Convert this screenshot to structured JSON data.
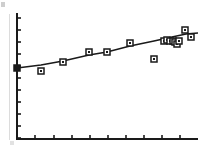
{
  "figure": {
    "background_color": "#ffffff",
    "ink_color": "#1a1a1a",
    "artifact_color": "#dcdcdc",
    "width": 198,
    "height": 151
  },
  "axes": {
    "x_axis_y": 139,
    "y_axis_x": 17,
    "plot_left": 17,
    "plot_right": 198,
    "plot_top": 14,
    "plot_bottom": 139,
    "axis_line_width": 2,
    "tick_length": 4,
    "tick_line_width": 1.6,
    "x_ticks_px": [
      17,
      35,
      54,
      72,
      90,
      108,
      126,
      144,
      162,
      180
    ],
    "y_ticks_px": [
      18,
      30,
      42,
      54,
      66,
      78,
      90,
      102,
      114,
      126,
      138
    ],
    "x_tick_labels": [],
    "y_tick_labels": [],
    "grid": "off"
  },
  "chart_data": {
    "type": "scatter",
    "title": "",
    "subtitle": "",
    "xlabel": "",
    "ylabel": "",
    "xlim": [
      0,
      100
    ],
    "ylim": [
      0,
      100
    ],
    "grid": "off",
    "legend": "none",
    "marker_style": "open-square",
    "marker_size_px": 6,
    "series": [
      {
        "name": "observations",
        "marker": "open-square",
        "x": [
          0.0,
          9.5,
          23.5,
          39.5,
          50.5,
          61.0,
          73.0,
          80.0,
          82.0,
          83.5,
          85.5,
          87.5,
          89.0,
          90.5,
          97.0,
          99.5
        ],
        "y": [
          51.0,
          47.5,
          57.5,
          65.5,
          65.5,
          72.5,
          52.0,
          73.0,
          73.5,
          73.0,
          72.5,
          72.0,
          70.0,
          72.5,
          80.5,
          75.5
        ],
        "points_px": [
          {
            "x": 17,
            "y": 68,
            "style": "filled-square"
          },
          {
            "x": 41,
            "y": 71,
            "style": "open-square"
          },
          {
            "x": 63,
            "y": 62,
            "style": "open-square"
          },
          {
            "x": 89,
            "y": 52,
            "style": "open-square"
          },
          {
            "x": 107,
            "y": 52,
            "style": "open-square"
          },
          {
            "x": 130,
            "y": 43,
            "style": "open-square"
          },
          {
            "x": 154,
            "y": 59,
            "style": "open-square"
          },
          {
            "x": 164,
            "y": 41,
            "style": "open-square"
          },
          {
            "x": 167,
            "y": 40,
            "style": "open-square"
          },
          {
            "x": 170,
            "y": 41,
            "style": "open-square"
          },
          {
            "x": 173,
            "y": 41,
            "style": "open-square"
          },
          {
            "x": 175,
            "y": 42,
            "style": "open-square"
          },
          {
            "x": 177,
            "y": 44,
            "style": "open-square"
          },
          {
            "x": 179,
            "y": 41,
            "style": "open-square"
          },
          {
            "x": 185,
            "y": 30,
            "style": "open-square"
          },
          {
            "x": 191,
            "y": 37,
            "style": "open-square"
          }
        ]
      }
    ],
    "fit_line": {
      "name": "fitted trend line",
      "style": "solid",
      "width_px": 1.6,
      "path_px": [
        {
          "x": 17,
          "y": 68
        },
        {
          "x": 41,
          "y": 65
        },
        {
          "x": 63,
          "y": 61
        },
        {
          "x": 89,
          "y": 55
        },
        {
          "x": 107,
          "y": 52
        },
        {
          "x": 130,
          "y": 46
        },
        {
          "x": 154,
          "y": 41
        },
        {
          "x": 172,
          "y": 37
        },
        {
          "x": 186,
          "y": 34
        },
        {
          "x": 198,
          "y": 33
        }
      ]
    },
    "annotations": [
      {
        "label": "low outlier",
        "x_px": 154,
        "y_px": 59
      },
      {
        "label": "dense overlapping cluster",
        "x_px": 172,
        "y_px": 41
      }
    ]
  }
}
